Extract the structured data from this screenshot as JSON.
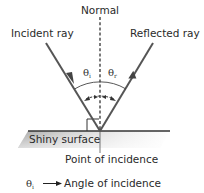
{
  "diagram": {
    "labels": {
      "normal": "Normal",
      "incident_ray": "Incident ray",
      "reflected_ray": "Reflected ray",
      "surface": "Shiny surface",
      "point": "Point of incidence"
    },
    "angles": {
      "incident_symbol": "θ",
      "incident_sub": "i",
      "reflected_symbol": "θ",
      "reflected_sub": "r"
    },
    "legend": {
      "symbol": "θ",
      "sub": "i",
      "arrow": "⟶",
      "text": "Angle of incidence"
    },
    "colors": {
      "ray": "#555555",
      "line": "#333333",
      "surface_shade": "#9a9a9a"
    }
  }
}
